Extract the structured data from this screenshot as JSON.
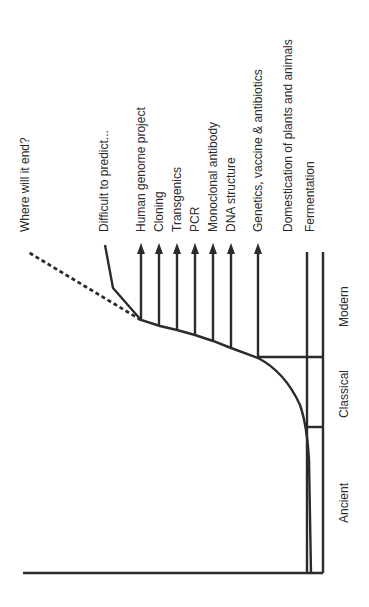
{
  "diagram": {
    "type": "timeline-growth-curve",
    "eras": [
      {
        "label": "Ancient"
      },
      {
        "label": "Classical"
      },
      {
        "label": "Modern"
      }
    ],
    "milestones": [
      {
        "label": "Fermentation",
        "marker": "line"
      },
      {
        "label": "Domestication of plants and animals",
        "marker": "line"
      },
      {
        "label": "Genetics, vaccine & antibiotics",
        "marker": "arrow"
      },
      {
        "label": "DNA structure",
        "marker": "arrow"
      },
      {
        "label": "Monoclonal antibody",
        "marker": "arrow"
      },
      {
        "label": "PCR",
        "marker": "arrow"
      },
      {
        "label": "Transgenics",
        "marker": "arrow"
      },
      {
        "label": "Cloning",
        "marker": "arrow"
      },
      {
        "label": "Human genome project",
        "marker": "arrow"
      }
    ],
    "future": {
      "solid_label": "Difficult to predict...",
      "dashed_label": "Where will it end?"
    },
    "colors": {
      "line": "#2b2b2b",
      "text": "#2b2b2b",
      "background": "#ffffff"
    }
  }
}
